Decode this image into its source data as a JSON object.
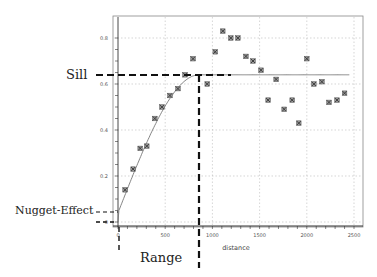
{
  "chart_data": {
    "type": "scatter",
    "title": "",
    "xlabel": "distance",
    "ylabel": "",
    "xlim": [
      0,
      2500
    ],
    "ylim": [
      0,
      0.85
    ],
    "x_ticks": [
      "0",
      "500",
      "1000",
      "1500",
      "2000",
      "2500"
    ],
    "y_ticks": [
      "0",
      "0.2",
      "0.4",
      "0.6",
      "0.8"
    ],
    "grid": true,
    "series": [
      {
        "name": "empirical semivariogram",
        "marker": "x-box",
        "points": [
          [
            75,
            0.14
          ],
          [
            160,
            0.23
          ],
          [
            235,
            0.32
          ],
          [
            305,
            0.33
          ],
          [
            390,
            0.45
          ],
          [
            465,
            0.5
          ],
          [
            550,
            0.55
          ],
          [
            635,
            0.58
          ],
          [
            710,
            0.64
          ],
          [
            795,
            0.71
          ],
          [
            945,
            0.6
          ],
          [
            1030,
            0.74
          ],
          [
            1110,
            0.83
          ],
          [
            1195,
            0.8
          ],
          [
            1270,
            0.8
          ],
          [
            1355,
            0.72
          ],
          [
            1430,
            0.7
          ],
          [
            1515,
            0.66
          ],
          [
            1590,
            0.53
          ],
          [
            1675,
            0.62
          ],
          [
            1760,
            0.49
          ],
          [
            1845,
            0.53
          ],
          [
            1915,
            0.43
          ],
          [
            2000,
            0.71
          ],
          [
            2075,
            0.6
          ],
          [
            2160,
            0.61
          ],
          [
            2235,
            0.52
          ],
          [
            2320,
            0.53
          ],
          [
            2400,
            0.56
          ]
        ]
      },
      {
        "name": "fitted model",
        "type": "line",
        "model": "spherical",
        "nugget": 0.04,
        "sill": 0.64,
        "range": 860
      }
    ],
    "annotations": [
      {
        "label": "Sill",
        "value": 0.64,
        "axis": "y"
      },
      {
        "label": "Range",
        "value": 860,
        "axis": "x"
      },
      {
        "label": "Nugget-Effect",
        "value": 0.04,
        "axis": "y"
      }
    ]
  },
  "labels": {
    "sill": "Sill",
    "range": "Range",
    "nugget": "Nugget-Effect",
    "xlabel": "distance",
    "x_ticks": [
      "0",
      "500",
      "1000",
      "1500",
      "2000",
      "2500"
    ],
    "y_ticks": [
      "0",
      "0.2",
      "0.4",
      "0.6",
      "0.8"
    ]
  }
}
